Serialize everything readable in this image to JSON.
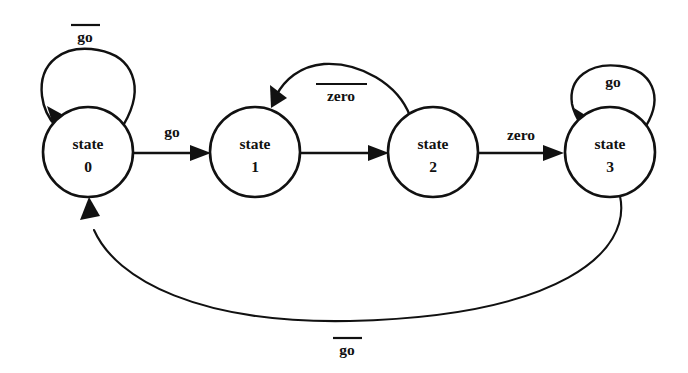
{
  "diagram": {
    "kind": "finite-state-machine",
    "title": "",
    "background_color": "#ffffff",
    "line_color": "#111111",
    "states": [
      {
        "id": "s0",
        "line1": "state",
        "line2": "0",
        "cx": 88,
        "cy": 152,
        "r": 45
      },
      {
        "id": "s1",
        "line1": "state",
        "line2": "1",
        "cx": 255,
        "cy": 152,
        "r": 45
      },
      {
        "id": "s2",
        "line1": "state",
        "line2": "2",
        "cx": 433,
        "cy": 152,
        "r": 45
      },
      {
        "id": "s3",
        "line1": "state",
        "line2": "3",
        "cx": 610,
        "cy": 152,
        "r": 45
      }
    ],
    "transitions": [
      {
        "id": "t-s0-self",
        "from": "state 0",
        "to": "state 0",
        "label": "go",
        "overline": true,
        "shape": "self-loop-top",
        "label_x": 85,
        "label_y": 38
      },
      {
        "id": "t-s0-s1",
        "from": "state 0",
        "to": "state 1",
        "label": "go",
        "overline": false,
        "shape": "straight",
        "label_x": 172,
        "label_y": 133
      },
      {
        "id": "t-s1-s2",
        "from": "state 1",
        "to": "state 2",
        "label": "",
        "overline": false,
        "shape": "straight",
        "label_x": 344,
        "label_y": 133
      },
      {
        "id": "t-s2-s1",
        "from": "state 2",
        "to": "state 1",
        "label": "zero",
        "overline": true,
        "shape": "arc-above",
        "label_x": 341,
        "label_y": 97
      },
      {
        "id": "t-s2-s3",
        "from": "state 2",
        "to": "state 3",
        "label": "zero",
        "overline": false,
        "shape": "straight",
        "label_x": 521,
        "label_y": 136
      },
      {
        "id": "t-s3-self",
        "from": "state 3",
        "to": "state 3",
        "label": "go",
        "overline": false,
        "shape": "self-loop-top",
        "label_x": 613,
        "label_y": 83
      },
      {
        "id": "t-s3-s0",
        "from": "state 3",
        "to": "state 0",
        "label": "go",
        "overline": true,
        "shape": "arc-below",
        "label_x": 347,
        "label_y": 351
      }
    ]
  }
}
